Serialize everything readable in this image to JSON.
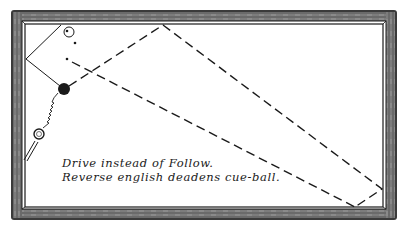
{
  "diagram": {
    "type": "billiard-table-shot",
    "colors": {
      "ink": "#1a1a1a",
      "rail_dark": "#3a3a3a",
      "rail_mid": "#8a8a8a",
      "cloth": "#ffffff"
    },
    "table": {
      "outer": {
        "x": 11,
        "y": 10,
        "w": 386,
        "h": 210
      },
      "inner": {
        "x": 24,
        "y": 24,
        "w": 359,
        "h": 184
      }
    },
    "balls": [
      {
        "name": "object-ball-white",
        "cx": 69,
        "cy": 32,
        "r": 5,
        "fill": "#ffffff"
      },
      {
        "name": "object-ball-black",
        "cx": 64,
        "cy": 89,
        "r": 6,
        "fill": "#1a1a1a"
      },
      {
        "name": "cue-ball",
        "cx": 39,
        "cy": 134,
        "r": 5,
        "fill": "#ffffff"
      }
    ],
    "paths": {
      "solid_object_ball": [
        [
          64,
          89
        ],
        [
          26,
          59
        ],
        [
          61,
          25
        ]
      ],
      "dashed_cue_ball": [
        [
          64,
          89
        ],
        [
          163,
          25
        ],
        [
          382,
          189
        ],
        [
          355,
          207
        ]
      ],
      "dashed_second": [
        [
          67,
          59
        ],
        [
          355,
          207
        ]
      ]
    },
    "caption": {
      "line1": "Drive instead of Follow.",
      "line2": "Reverse english deadens cue-ball."
    }
  }
}
